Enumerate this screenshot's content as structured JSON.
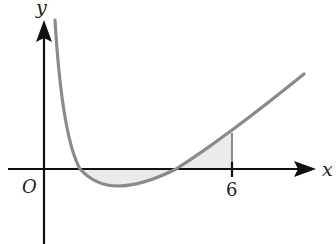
{
  "diagram": {
    "axes": {
      "x_label": "x",
      "y_label": "y",
      "origin_label": "O"
    },
    "ticks": [
      {
        "label": "6",
        "x_value": 6
      }
    ],
    "curve": {
      "description": "Curve decreasing steeply from top near y-axis, dipping below x-axis, then rising; area between curve and x-axis from first root to x=6 is shaded",
      "color": "#8a8a8a"
    },
    "shaded_region": {
      "fill": "#ebebeb",
      "from": "first x-intercept",
      "to": "x = 6"
    },
    "colors": {
      "axes": "#111111",
      "curve": "#8a8a8a",
      "shade": "#ebebeb",
      "text": "#222222"
    }
  }
}
